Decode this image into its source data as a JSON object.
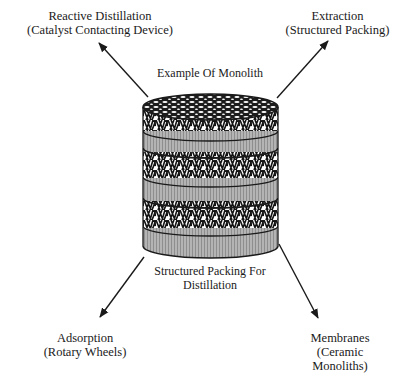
{
  "diagram": {
    "center_caption_top": "Example Of Monolith",
    "center_caption_bottom": [
      "Structured Packing For",
      "Distillation"
    ],
    "applications": [
      {
        "id": "reactive-distillation",
        "title": "Reactive Distillation",
        "subtitle": "(Catalyst Contacting Device)",
        "position": "top-left"
      },
      {
        "id": "extraction",
        "title": "Extraction",
        "subtitle": "(Structured Packing)",
        "position": "top-right"
      },
      {
        "id": "adsorption",
        "title": "Adsorption",
        "subtitle": "(Rotary Wheels)",
        "position": "bottom-left"
      },
      {
        "id": "membranes",
        "title": "Membranes",
        "subtitle": [
          "(Ceramic",
          "Monoliths)"
        ],
        "position": "bottom-right"
      }
    ],
    "central_object": "monolith-cylinder",
    "colors": {
      "ink": "#1a1a1a",
      "band_gray": "#a8a8a8",
      "background": "#ffffff"
    }
  }
}
